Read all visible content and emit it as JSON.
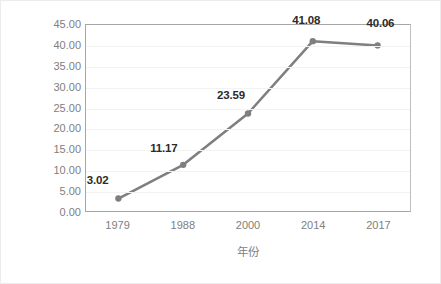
{
  "chart_data": {
    "type": "line",
    "title": "",
    "xlabel": "年份",
    "ylabel": "流入率（%）",
    "categories": [
      "1979",
      "1988",
      "2000",
      "2014",
      "2017"
    ],
    "values": [
      3.02,
      11.17,
      23.59,
      41.08,
      40.06
    ],
    "data_labels": [
      "3.02",
      "11.17",
      "23.59",
      "41.08",
      "40.06"
    ],
    "series": [
      {
        "name": "流入率",
        "values": [
          3.02,
          11.17,
          23.59,
          41.08,
          40.06
        ]
      }
    ],
    "ylim": [
      0,
      45
    ],
    "ytick_step": 5,
    "ytick_labels": [
      "0.00",
      "5.00",
      "10.00",
      "15.00",
      "20.00",
      "25.00",
      "30.00",
      "35.00",
      "40.00",
      "45.00"
    ],
    "ytick_values": [
      0,
      5,
      10,
      15,
      20,
      25,
      30,
      35,
      40,
      45
    ],
    "grid": true,
    "grid_axis": "y",
    "legend": false,
    "legend_position": "none",
    "line_color": "#7f7f7f",
    "marker_color": "#7f7f7f",
    "marker_shape": "circle",
    "axis_color": "#a6a6a6",
    "gridline_color": "#f2f2f2",
    "tick_label_color": "#808080",
    "data_label_color": "#2b2b2b",
    "background_color": "#ffffff"
  }
}
